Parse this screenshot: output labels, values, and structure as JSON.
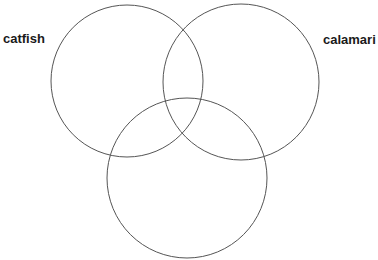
{
  "diagram": {
    "type": "venn",
    "stroke_color": "#555555",
    "background": "#ffffff",
    "sets": [
      {
        "label": "catfish",
        "cx": 127,
        "cy": 81,
        "r": 76
      },
      {
        "label": "calamari",
        "cx": 241,
        "cy": 82,
        "r": 78
      },
      {
        "label": "",
        "cx": 187,
        "cy": 178,
        "r": 80
      }
    ]
  }
}
